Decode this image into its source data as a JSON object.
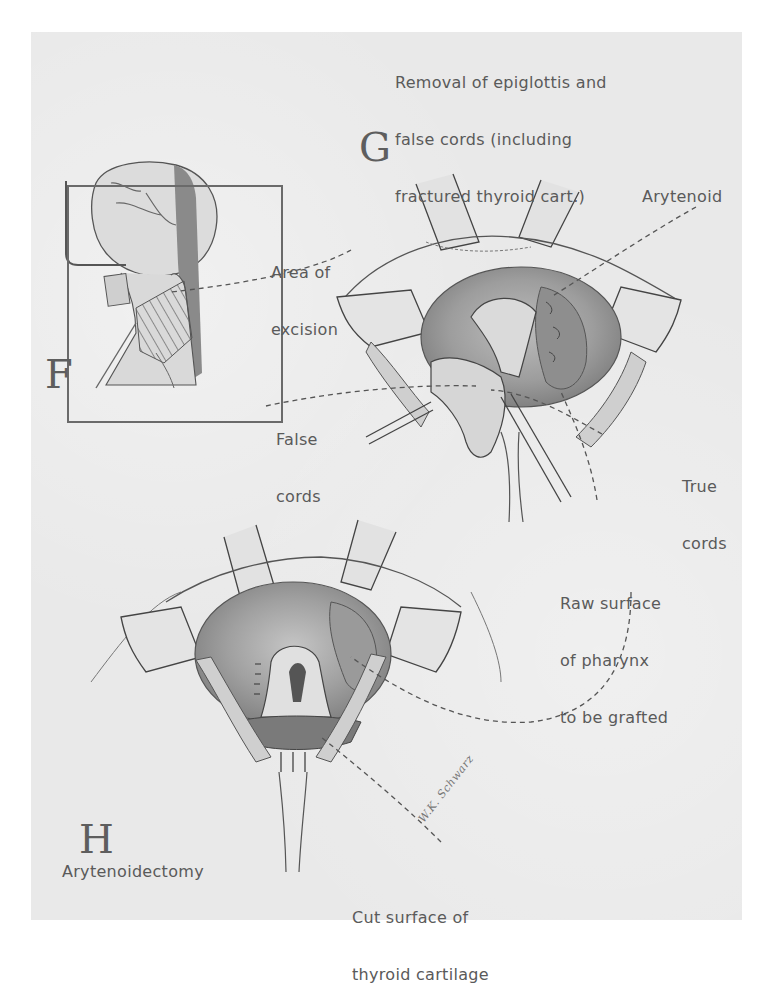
{
  "plate": {
    "background_color": "#e9e9e9",
    "ink_color": "#5a5a5a"
  },
  "panels": {
    "F": {
      "letter": "F",
      "labels": {
        "area_of_excision": [
          "Area of",
          "excision"
        ]
      }
    },
    "G": {
      "letter": "G",
      "caption": [
        "Removal of epiglottis and",
        "false cords (including",
        "fractured thyroid cart.)"
      ],
      "labels": {
        "arytenoid": "Arytenoid",
        "false_cords": [
          "False",
          "cords"
        ],
        "true_cords": [
          "True",
          "cords"
        ],
        "raw_surface": [
          "Raw surface",
          "of pharynx",
          "to be grafted"
        ]
      }
    },
    "H": {
      "letter": "H",
      "caption": "Arytenoidectomy",
      "labels": {
        "cut_surface": [
          "Cut surface of",
          "thyroid cartilage"
        ]
      }
    }
  },
  "signature": "W.K. Schwarz",
  "icons": {
    "leader_line": "dashed-leader-line"
  }
}
